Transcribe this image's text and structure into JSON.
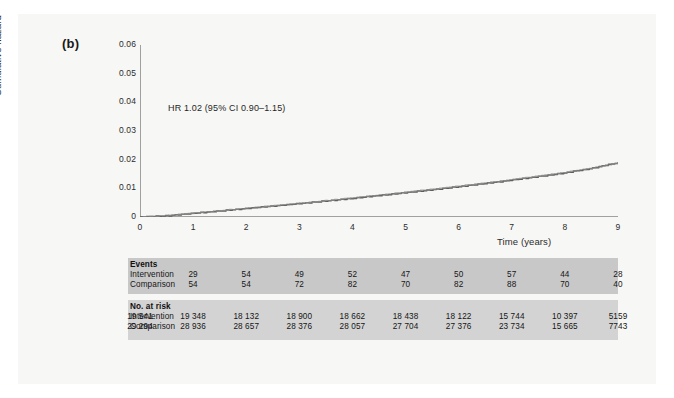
{
  "figure": {
    "panel_label": "(b)",
    "annotation": "HR 1.02 (95% CI 0.90–1.15)"
  },
  "chart_data": {
    "type": "line",
    "title": "",
    "subtitle": "",
    "xlabel": "Time (years)",
    "ylabel": "Cumulative hazard",
    "xlim": [
      0,
      9
    ],
    "ylim": [
      0,
      0.06
    ],
    "xticks": [
      "0",
      "1",
      "2",
      "3",
      "4",
      "5",
      "6",
      "7",
      "8",
      "9"
    ],
    "yticks": [
      "0",
      "0.01",
      "0.02",
      "0.03",
      "0.04",
      "0.05",
      "0.06"
    ],
    "grid": false,
    "legend_position": "none",
    "annotations": [
      "HR 1.02 (95% CI 0.90–1.15)"
    ],
    "x": [
      0,
      0.5,
      1,
      1.5,
      2,
      2.5,
      3,
      3.5,
      4,
      4.5,
      5,
      5.5,
      6,
      6.5,
      7,
      7.5,
      8,
      8.5,
      9
    ],
    "series": [
      {
        "name": "Intervention",
        "color": "#555555",
        "values": [
          0,
          0.0004,
          0.0013,
          0.0021,
          0.003,
          0.0038,
          0.0047,
          0.0056,
          0.0065,
          0.0075,
          0.0085,
          0.0095,
          0.0106,
          0.0117,
          0.0129,
          0.0141,
          0.0154,
          0.017,
          0.019
        ]
      },
      {
        "name": "Comparison",
        "color": "#8e8e8e",
        "values": [
          0,
          0.0005,
          0.0014,
          0.0022,
          0.0031,
          0.0039,
          0.0048,
          0.0057,
          0.0067,
          0.0077,
          0.0087,
          0.0097,
          0.0108,
          0.0119,
          0.0131,
          0.0143,
          0.0156,
          0.0171,
          0.0189
        ]
      }
    ]
  },
  "risk_table": {
    "groups": [
      {
        "title": "Events",
        "rows": [
          {
            "label": "Intervention",
            "values": [
              "",
              "29",
              "54",
              "49",
              "52",
              "47",
              "50",
              "57",
              "44",
              "28"
            ]
          },
          {
            "label": "Comparison",
            "values": [
              "",
              "54",
              "54",
              "72",
              "82",
              "70",
              "82",
              "88",
              "70",
              "40"
            ]
          }
        ]
      },
      {
        "title": "No. at risk",
        "rows": [
          {
            "label": "Intervention",
            "values": [
              "19 541",
              "19 348",
              "18 132",
              "18 900",
              "18 662",
              "18 438",
              "18 122",
              "15 744",
              "10 397",
              "5159"
            ]
          },
          {
            "label": "Comparison",
            "values": [
              "29 294",
              "28 936",
              "28 657",
              "28 376",
              "28 057",
              "27 704",
              "27 376",
              "23 734",
              "15 665",
              "7743"
            ]
          }
        ]
      }
    ]
  },
  "colors": {
    "page_background": "#ffffff",
    "paper": "#f7f7f5",
    "events_band": "#c8c8c8",
    "atrisk_band": "#d3d3d3",
    "axis": "#4a4a4a",
    "text": "#151515"
  }
}
